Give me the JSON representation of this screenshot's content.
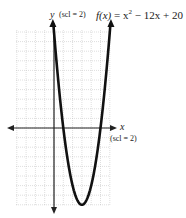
{
  "chart_data": {
    "type": "line",
    "function": "x^2 - 12x + 20",
    "xlabel": "x",
    "ylabel": "y",
    "x_scale_label": "(scl = 2)",
    "y_scale_label": "(scl = 2)",
    "x_scale": 2,
    "y_scale": 2,
    "grid": true,
    "xlim": [
      -8,
      12
    ],
    "ylim": [
      -16,
      20
    ],
    "vertex": [
      6,
      -16
    ],
    "x_intercepts": [
      2,
      10
    ],
    "y_intercept": 20,
    "x": [
      -0.5,
      0,
      1,
      2,
      3,
      4,
      5,
      6,
      7,
      8,
      9,
      10,
      11,
      12,
      12.5
    ],
    "y": [
      26.25,
      20,
      9,
      0,
      -7,
      -12,
      -15,
      -16,
      -15,
      -12,
      -7,
      0,
      9,
      20,
      26.25
    ]
  },
  "labels": {
    "y_axis": "y",
    "y_scl": "(scl = 2)",
    "x_axis": "x",
    "x_scl": "(scl = 2)",
    "func_lhs": "f(x)",
    "func_eq": " = x",
    "func_exp": "2",
    "func_rest": " − 12x + 20"
  }
}
